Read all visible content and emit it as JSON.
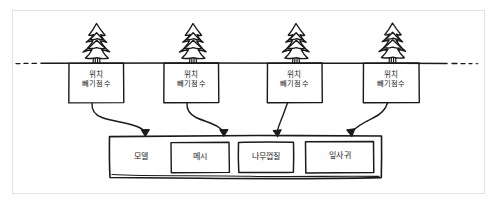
{
  "diagram": {
    "style": "hand-drawn sketch",
    "ground_line": {
      "name": "horizon-dashed-line",
      "style": "dashed-ends-solid-middle"
    },
    "trees": [
      {
        "icon": "pine-tree-icon",
        "label_line1": "위치",
        "label_line2": "빼기점수"
      },
      {
        "icon": "pine-tree-icon",
        "label_line1": "위치",
        "label_line2": "빼기점수"
      },
      {
        "icon": "pine-tree-icon",
        "label_line1": "위치",
        "label_line2": "빼기점수"
      },
      {
        "icon": "pine-tree-icon",
        "label_line1": "위치",
        "label_line2": "빼기점수"
      }
    ],
    "arrows": [
      {
        "name": "arrow-tree-1-to-model"
      },
      {
        "name": "arrow-tree-2-to-model"
      },
      {
        "name": "arrow-tree-3-to-model"
      },
      {
        "name": "arrow-tree-4-to-model"
      }
    ],
    "model_container": {
      "label": "모델",
      "parts": [
        {
          "label": "메시"
        },
        {
          "label": "나무껍질"
        },
        {
          "label": "잎사귀"
        }
      ]
    },
    "colors": {
      "ink": "#1a1a1a",
      "frame": "#e2e2e2",
      "paper": "#ffffff"
    }
  }
}
